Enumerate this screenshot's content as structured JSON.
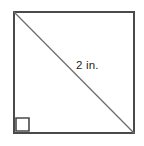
{
  "figure": {
    "name": "square-with-diagonal",
    "background_color": "#ffffff",
    "outline_color": "#4a4a4a",
    "diagonal_color": "#6e6e6e",
    "label_color": "#231f20",
    "square": {
      "x": 13,
      "y": 11,
      "width": 122,
      "height": 123,
      "stroke_width": 2
    },
    "diagonal": {
      "x1": 14,
      "y1": 12,
      "x2": 134,
      "y2": 133,
      "stroke_width": 1.3
    },
    "right_angle_marker": {
      "x": 16,
      "y": 118,
      "size": 13,
      "stroke_width": 1.6
    },
    "label": {
      "text": "2 in.",
      "value": 2,
      "unit": "in.",
      "x": 76,
      "y": 58
    }
  }
}
